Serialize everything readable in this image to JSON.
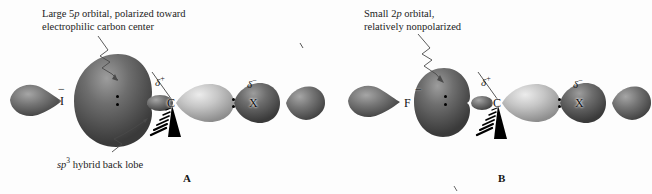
{
  "figure": {
    "background_color": "#fdfdfd"
  },
  "panels": [
    {
      "id": "A",
      "letter": "A",
      "caption_lines": [
        "Large 5p orbital, polarized toward",
        "electrophilic carbon center"
      ],
      "caption_line1_pre": "Large 5",
      "caption_line1_italic": "p",
      "caption_line1_post": " orbital, polarized toward",
      "caption_line2": "electrophilic carbon center",
      "sub_caption_italic": "sp",
      "sub_caption_sup": "3",
      "sub_caption_rest": " hybrid back lobe",
      "nucleophile_label": "I",
      "nucleophile_charge": "−",
      "carbon_label": "C",
      "carbon_charge_symbol": "δ",
      "carbon_charge_sign": "+",
      "leaving_group_label": "X",
      "leaving_group_charge_symbol": "δ",
      "leaving_group_charge_sign": "−"
    },
    {
      "id": "B",
      "letter": "B",
      "caption_line1_pre": "Small 2",
      "caption_line1_italic": "p",
      "caption_line1_post": " orbital,",
      "caption_line2": "relatively nonpolarized",
      "nucleophile_label": "F",
      "nucleophile_charge": "−",
      "carbon_label": "C",
      "carbon_charge_symbol": "δ",
      "carbon_charge_sign": "+",
      "leaving_group_label": "X",
      "leaving_group_charge_symbol": "δ",
      "leaving_group_charge_sign": "−"
    }
  ],
  "colors": {
    "dark_lobe": "#6a6a6a",
    "dark_lobe_shadow": "#3d3d3d",
    "dark_lobe_highlight": "#9a9a9a",
    "light_lobe": "#c8c8c8",
    "light_lobe_shadow": "#8e8e8e",
    "light_lobe_highlight": "#e8e8e8",
    "text": "#111111",
    "leader_line": "#555555",
    "wedge": "#000000"
  }
}
